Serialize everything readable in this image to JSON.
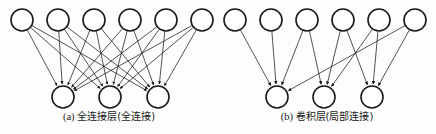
{
  "figure": {
    "width": 436,
    "height": 134,
    "background_color": "#fdfdfd",
    "stroke_color": "#1a1a1a",
    "node_fill_color": "#ffffff"
  },
  "panels": [
    {
      "id": "fully-connected",
      "caption_label": "(a)",
      "caption_text": "全连接层(全连接)",
      "layers": {
        "top": {
          "name": "input-layer",
          "count": 6,
          "radius": 11,
          "cy": 20,
          "cx": [
            22,
            58,
            94,
            130,
            166,
            202
          ]
        },
        "bottom": {
          "name": "output-layer",
          "count": 3,
          "radius": 11,
          "cy": 97,
          "cx": [
            63,
            110,
            158
          ]
        }
      },
      "edges": [
        [
          0,
          0
        ],
        [
          0,
          1
        ],
        [
          0,
          2
        ],
        [
          1,
          0
        ],
        [
          1,
          1
        ],
        [
          1,
          2
        ],
        [
          2,
          0
        ],
        [
          2,
          1
        ],
        [
          2,
          2
        ],
        [
          3,
          0
        ],
        [
          3,
          1
        ],
        [
          3,
          2
        ],
        [
          4,
          0
        ],
        [
          4,
          1
        ],
        [
          4,
          2
        ],
        [
          5,
          0
        ],
        [
          5,
          1
        ],
        [
          5,
          2
        ]
      ]
    },
    {
      "id": "convolutional",
      "caption_label": "(b)",
      "caption_text": "卷积层(局部连接)",
      "layers": {
        "top": {
          "name": "input-layer",
          "count": 6,
          "radius": 11,
          "cy": 20,
          "cx": [
            17,
            53,
            89,
            125,
            161,
            197
          ]
        },
        "bottom": {
          "name": "output-layer",
          "count": 3,
          "radius": 11,
          "cy": 97,
          "cx": [
            59,
            106,
            154
          ]
        }
      },
      "edges": [
        [
          0,
          0
        ],
        [
          1,
          0
        ],
        [
          2,
          0
        ],
        [
          2,
          1
        ],
        [
          3,
          1
        ],
        [
          4,
          1
        ],
        [
          4,
          2
        ],
        [
          5,
          2
        ],
        [
          5,
          0
        ],
        [
          3,
          2
        ]
      ]
    }
  ]
}
